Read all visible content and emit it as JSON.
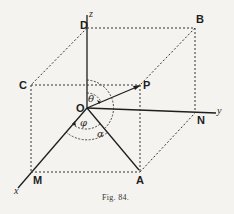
{
  "figure": {
    "caption": "Fig. 84.",
    "background_color": "#f4f3ef",
    "ink_color": "#1e1e1e"
  },
  "points": {
    "O": "O",
    "P": "P",
    "A": "A",
    "B": "B",
    "C": "C",
    "D": "D",
    "M": "M",
    "N": "N"
  },
  "axes": {
    "x": "x",
    "y": "y",
    "z": "z"
  },
  "angles": {
    "theta": "θ",
    "phi": "φ",
    "alpha": "α"
  }
}
